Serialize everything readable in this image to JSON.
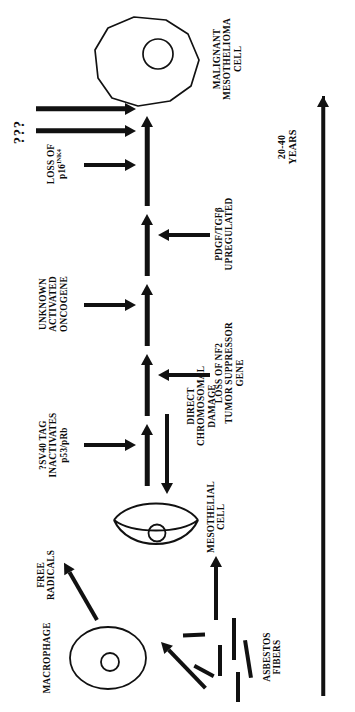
{
  "figure": {
    "title_semantic": "asbestos-induced-malignant-mesothelioma-pathogenesis",
    "timeline": {
      "label_line1": "20-40",
      "label_line2": "YEARS",
      "arrow_icon": "long-up-arrow-icon"
    },
    "cells": {
      "macrophage": {
        "label": "MACROPHAGE",
        "shape": "oval-cell-with-nucleus"
      },
      "mesothelial": {
        "label_line1": "MESOTHELIAL",
        "label_line2": "CELL",
        "shape": "crescent-cell-with-nucleus"
      },
      "malignant": {
        "label_line1": "MALIGNANT",
        "label_line2": "MESOTHELIOMA",
        "label_line3": "CELL",
        "shape": "irregular-polygon-cell-with-nucleus"
      }
    },
    "initiators": {
      "asbestos": {
        "label_line1": "ASBESTOS",
        "label_line2": "FIBERS",
        "shape": "scattered-fiber-segments"
      },
      "free_radicals": {
        "label_line1": "FREE",
        "label_line2": "RADICALS"
      },
      "direct_damage": {
        "label_line1": "DIRECT",
        "label_line2": "CHROMOSOMAL",
        "label_line3": "DAMAGE"
      }
    },
    "events": [
      {
        "id": "sv40",
        "label_line1": "?SV40 TAG",
        "label_line2": "INACTIVATES",
        "label_line3": "p53/pRb"
      },
      {
        "id": "nf2",
        "label_line1": "LOSS OF NF2",
        "label_line2": "TUMOR SUPPRESSOR",
        "label_line3": "GENE"
      },
      {
        "id": "oncogene",
        "label_line1": "UNKNOWN",
        "label_line2": "ACTIVATED",
        "label_line3": "ONCOGENE"
      },
      {
        "id": "pdgf",
        "label_line1": "PDGF/TGFβ",
        "label_line2": "UPREGULATED"
      },
      {
        "id": "p16",
        "label_line1": "LOSS OF",
        "label_line2_base": "p16",
        "label_line2_sup": "INK4"
      },
      {
        "id": "unknown",
        "label": "???"
      }
    ],
    "colors": {
      "ink": "#111111",
      "background": "#ffffff"
    }
  }
}
